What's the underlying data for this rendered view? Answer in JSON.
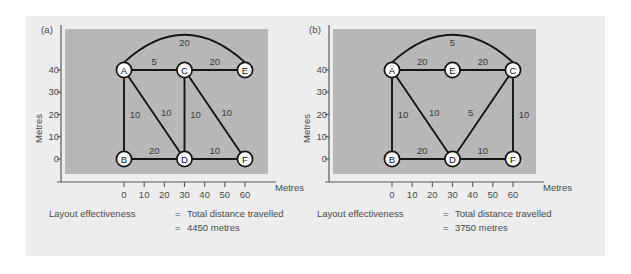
{
  "figure": {
    "background_color": "#ffffff",
    "card_color": "#ededed",
    "plot_color": "#b7b7b7",
    "line_color": "#151515",
    "text_color": "#4b4b4b"
  },
  "panels": [
    {
      "id": "a",
      "label": "(a)",
      "axes": {
        "y_title": "Metres",
        "x_title": "Metres",
        "y_ticks": [
          "0",
          "10",
          "20",
          "30",
          "40"
        ],
        "x_ticks": [
          "0",
          "10",
          "20",
          "30",
          "40",
          "50",
          "60"
        ],
        "x_range": [
          -10,
          70
        ],
        "y_range": [
          -12,
          52
        ]
      },
      "caption": {
        "line1_left": "Layout effectiveness",
        "line1_eq": "=",
        "line1_right": "Total distance travelled",
        "line2_eq": "=",
        "line2_right": "4450 metres"
      },
      "nodes": [
        {
          "id": "A",
          "x": 0,
          "y": 40
        },
        {
          "id": "B",
          "x": 0,
          "y": 0
        },
        {
          "id": "C",
          "x": 30,
          "y": 40
        },
        {
          "id": "D",
          "x": 30,
          "y": 0
        },
        {
          "id": "E",
          "x": 60,
          "y": 40
        },
        {
          "id": "F",
          "x": 60,
          "y": 0
        }
      ],
      "edges": [
        {
          "from": "A",
          "to": "C",
          "label": "5",
          "shape": "line"
        },
        {
          "from": "C",
          "to": "E",
          "label": "20",
          "shape": "line"
        },
        {
          "from": "A",
          "to": "E",
          "label": "20",
          "shape": "arc"
        },
        {
          "from": "A",
          "to": "B",
          "label": "10",
          "shape": "line"
        },
        {
          "from": "A",
          "to": "D",
          "label": "10",
          "shape": "line"
        },
        {
          "from": "C",
          "to": "D",
          "label": "10",
          "shape": "line"
        },
        {
          "from": "C",
          "to": "F",
          "label": "10",
          "shape": "line"
        },
        {
          "from": "B",
          "to": "D",
          "label": "20",
          "shape": "line"
        },
        {
          "from": "D",
          "to": "F",
          "label": "10",
          "shape": "line"
        }
      ]
    },
    {
      "id": "b",
      "label": "(b)",
      "axes": {
        "y_title": "Metres",
        "x_title": "Metres",
        "y_ticks": [
          "0",
          "10",
          "20",
          "30",
          "40"
        ],
        "x_ticks": [
          "0",
          "10",
          "20",
          "30",
          "40",
          "50",
          "60"
        ],
        "x_range": [
          -10,
          70
        ],
        "y_range": [
          -12,
          52
        ]
      },
      "caption": {
        "line1_left": "Layout effectiveness",
        "line1_eq": "=",
        "line1_right": "Total distance travelled",
        "line2_eq": "=",
        "line2_right": "3750 metres"
      },
      "nodes": [
        {
          "id": "A",
          "x": 0,
          "y": 40
        },
        {
          "id": "B",
          "x": 0,
          "y": 0
        },
        {
          "id": "E",
          "x": 30,
          "y": 40
        },
        {
          "id": "D",
          "x": 30,
          "y": 0
        },
        {
          "id": "C",
          "x": 60,
          "y": 40
        },
        {
          "id": "F",
          "x": 60,
          "y": 0
        }
      ],
      "edges": [
        {
          "from": "A",
          "to": "E",
          "label": "20",
          "shape": "line"
        },
        {
          "from": "E",
          "to": "C",
          "label": "20",
          "shape": "line"
        },
        {
          "from": "A",
          "to": "C",
          "label": "5",
          "shape": "arc"
        },
        {
          "from": "A",
          "to": "B",
          "label": "10",
          "shape": "line"
        },
        {
          "from": "A",
          "to": "D",
          "label": "10",
          "shape": "line"
        },
        {
          "from": "D",
          "to": "C",
          "label": "5",
          "shape": "line"
        },
        {
          "from": "C",
          "to": "F",
          "label": "10",
          "shape": "line"
        },
        {
          "from": "B",
          "to": "D",
          "label": "20",
          "shape": "line"
        },
        {
          "from": "D",
          "to": "F",
          "label": "10",
          "shape": "line"
        }
      ]
    }
  ],
  "chart_data": {
    "type": "scatter",
    "xlabel": "Metres",
    "ylabel": "Metres",
    "xlim": [
      -10,
      70
    ],
    "ylim": [
      -12,
      52
    ],
    "grid": false,
    "legend": "none",
    "series": [
      {
        "name": "(a) layout - 4450 metres",
        "nodes": [
          {
            "id": "A",
            "x": 0,
            "y": 40
          },
          {
            "id": "B",
            "x": 0,
            "y": 0
          },
          {
            "id": "C",
            "x": 30,
            "y": 40
          },
          {
            "id": "D",
            "x": 30,
            "y": 0
          },
          {
            "id": "E",
            "x": 60,
            "y": 40
          },
          {
            "id": "F",
            "x": 60,
            "y": 0
          }
        ],
        "edge_weights": [
          {
            "edge": "A-C",
            "value": 5
          },
          {
            "edge": "C-E",
            "value": 20
          },
          {
            "edge": "A-E",
            "value": 20
          },
          {
            "edge": "A-B",
            "value": 10
          },
          {
            "edge": "A-D",
            "value": 10
          },
          {
            "edge": "C-D",
            "value": 10
          },
          {
            "edge": "C-F",
            "value": 10
          },
          {
            "edge": "B-D",
            "value": 20
          },
          {
            "edge": "D-F",
            "value": 10
          }
        ],
        "total_distance_travelled": 4450
      },
      {
        "name": "(b) layout - 3750 metres",
        "nodes": [
          {
            "id": "A",
            "x": 0,
            "y": 40
          },
          {
            "id": "B",
            "x": 0,
            "y": 0
          },
          {
            "id": "E",
            "x": 30,
            "y": 40
          },
          {
            "id": "D",
            "x": 30,
            "y": 0
          },
          {
            "id": "C",
            "x": 60,
            "y": 40
          },
          {
            "id": "F",
            "x": 60,
            "y": 0
          }
        ],
        "edge_weights": [
          {
            "edge": "A-E",
            "value": 20
          },
          {
            "edge": "E-C",
            "value": 20
          },
          {
            "edge": "A-C",
            "value": 5
          },
          {
            "edge": "A-B",
            "value": 10
          },
          {
            "edge": "A-D",
            "value": 10
          },
          {
            "edge": "D-C",
            "value": 5
          },
          {
            "edge": "C-F",
            "value": 10
          },
          {
            "edge": "B-D",
            "value": 20
          },
          {
            "edge": "D-F",
            "value": 10
          }
        ],
        "total_distance_travelled": 3750
      }
    ]
  }
}
